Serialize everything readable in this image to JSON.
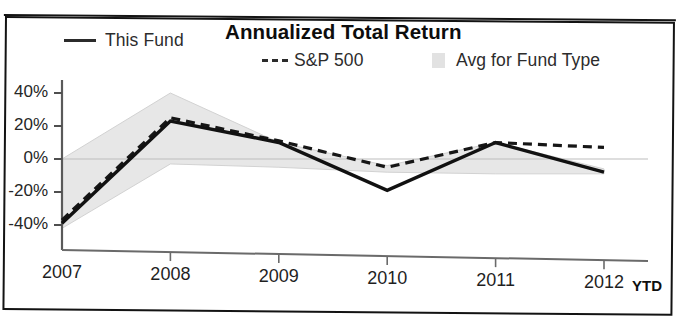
{
  "panel": {
    "title": "Annualized Total Return"
  },
  "legend": {
    "position": "top",
    "items": [
      {
        "label": "This Fund",
        "marker": "solid-line",
        "color": "#2b2b2b",
        "name": "legend-this-fund"
      },
      {
        "label": "S&P 500",
        "marker": "dashed-line",
        "color": "#2b2b2b",
        "name": "legend-sp500"
      },
      {
        "label": "Avg for Fund Type",
        "marker": "filled-box",
        "color": "#e2e2e2",
        "name": "legend-avg-for-fund-type"
      }
    ]
  },
  "axis": {
    "y_ticks": [
      "40%",
      "20%",
      "0%",
      "-20%",
      "-40%"
    ],
    "x_ticks": [
      "2007",
      "2008",
      "2009",
      "2010",
      "2011",
      "2012"
    ],
    "x_suffix": "YTD"
  },
  "chart_data": {
    "type": "line",
    "title": "Annualized Total Return",
    "xlabel": "",
    "ylabel": "",
    "x": [
      "2007",
      "2008",
      "2009",
      "2010",
      "2011",
      "2012"
    ],
    "x_note": "2012 value is YTD",
    "ylim": [
      -48,
      46
    ],
    "y_ticks": [
      40,
      20,
      0,
      -20,
      -40
    ],
    "y_tick_labels": [
      "40%",
      "20%",
      "0%",
      "-20%",
      "-40%"
    ],
    "grid": false,
    "legend_position": "top",
    "series": [
      {
        "name": "This Fund",
        "style": "solid",
        "color": "#1d1d1d",
        "values": [
          -39,
          23,
          10,
          -19,
          10,
          -8
        ]
      },
      {
        "name": "S&P 500",
        "style": "dashed",
        "color": "#1d1d1d",
        "values": [
          -37,
          25,
          11,
          -5,
          10,
          7
        ]
      },
      {
        "name": "Avg for Fund Type",
        "style": "band",
        "color": "#e6e6e6",
        "band_upper": [
          0,
          40,
          10,
          -4,
          10,
          -6
        ],
        "band_lower": [
          -42,
          -3,
          -5,
          -8,
          -9,
          -9
        ]
      }
    ]
  }
}
